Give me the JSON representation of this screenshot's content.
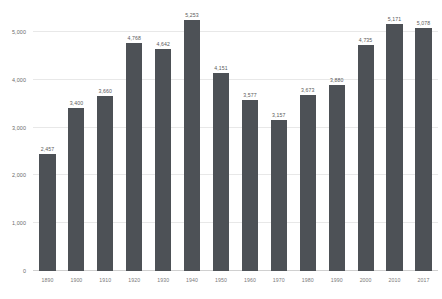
{
  "chart_data": {
    "type": "bar",
    "title": "",
    "subtitle": "",
    "xlabel": "",
    "ylabel": "",
    "legend": [],
    "grid": true,
    "ylim": [
      0,
      5500
    ],
    "y_ticks": [
      "0",
      "1,000",
      "2,000",
      "3,000",
      "4,000",
      "5,000"
    ],
    "y_tick_values": [
      0,
      1000,
      2000,
      3000,
      4000,
      5000
    ],
    "categories": [
      "1890",
      "1900",
      "1910",
      "1920",
      "1930",
      "1940",
      "1950",
      "1960",
      "1970",
      "1980",
      "1990",
      "2000",
      "2010",
      "2017"
    ],
    "values": [
      2457,
      3400,
      3660,
      4768,
      4642,
      5253,
      4151,
      3577,
      3157,
      3673,
      3880,
      4735,
      5171,
      5078
    ],
    "value_labels": [
      "2,457",
      "3,400",
      "3,660",
      "4,768",
      "4,642",
      "5,253",
      "4,151",
      "3,577",
      "3,157",
      "3,673",
      "3,880",
      "4,735",
      "5,171",
      "5,078"
    ],
    "bar_color": "#4d5156",
    "gridline_color": "#e8e8e8",
    "background_color": "#ffffff",
    "label_color": "#5a5a5a"
  }
}
